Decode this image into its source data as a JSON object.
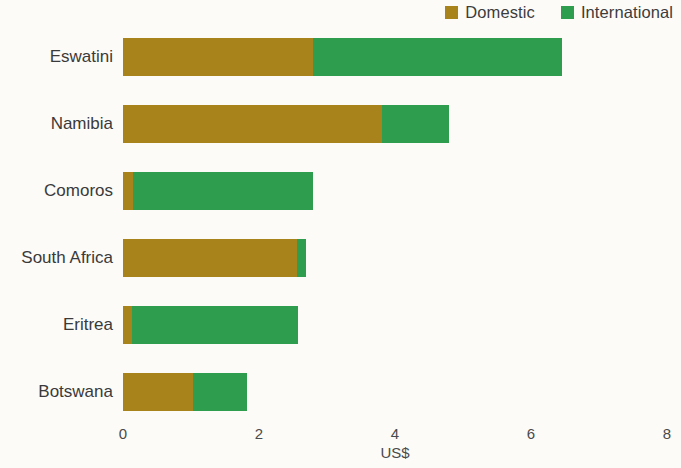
{
  "legend": {
    "position": "top-right",
    "entries": [
      {
        "label": "Domestic",
        "color": "#a8821a",
        "swatch_icon": "square-swatch-icon"
      },
      {
        "label": "International",
        "color": "#2e9e4e",
        "swatch_icon": "square-swatch-icon"
      }
    ]
  },
  "axis": {
    "x_title": "US$",
    "x_ticks": [
      "0",
      "2",
      "4",
      "6",
      "8"
    ]
  },
  "colors": {
    "domestic": "#a8821a",
    "international": "#2e9e4e",
    "background": "#fcfbf8",
    "text": "#3a3a3a"
  },
  "chart_data": {
    "type": "bar",
    "orientation": "horizontal",
    "stacked": true,
    "title": "",
    "subtitle": "",
    "xlabel": "US$",
    "ylabel": "",
    "xlim": [
      0,
      8
    ],
    "xticks": [
      0,
      2,
      4,
      6,
      8
    ],
    "grid": false,
    "legend_position": "top-right",
    "categories": [
      "Eswatini",
      "Namibia",
      "Comoros",
      "South Africa",
      "Eritrea",
      "Botswana"
    ],
    "series": [
      {
        "name": "Domestic",
        "color": "#a8821a",
        "values": [
          2.8,
          3.81,
          0.15,
          2.56,
          0.13,
          1.03
        ]
      },
      {
        "name": "International",
        "color": "#2e9e4e",
        "values": [
          3.65,
          0.98,
          2.64,
          0.13,
          2.44,
          0.79
        ]
      }
    ],
    "totals": [
      6.45,
      4.79,
      2.79,
      2.69,
      2.57,
      1.82
    ]
  }
}
